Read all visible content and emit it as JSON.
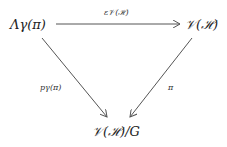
{
  "diagram": {
    "type": "commutative-triangle",
    "nodes": {
      "top_left": "Λγ(π)",
      "top_right": "𝒱(ℋ)",
      "bottom": "𝒱(ℋ)/G"
    },
    "arrows": {
      "top": {
        "from": "top_left",
        "to": "top_right",
        "label": "ε𝒱(ℋ)"
      },
      "left": {
        "from": "top_left",
        "to": "bottom",
        "label": "pγ(π)"
      },
      "right": {
        "from": "top_right",
        "to": "bottom",
        "label": "π"
      }
    },
    "line_color": "#555555"
  }
}
